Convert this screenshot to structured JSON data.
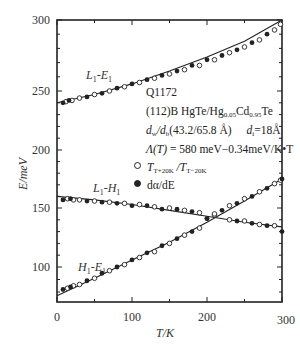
{
  "chart_data": {
    "type": "scatter",
    "title": "",
    "xlabel": "T/K",
    "ylabel": "E/meV",
    "xlim": [
      0,
      300
    ],
    "ylim": [
      72,
      300
    ],
    "xticks": [
      0,
      100,
      200,
      300
    ],
    "yticks": [
      100,
      150,
      200,
      250,
      300
    ],
    "grid": false,
    "legend_position": "inside right, middle",
    "legend": [
      {
        "marker": "open-circle",
        "label": "T_{T+20K}/T_{T-20K}"
      },
      {
        "marker": "filled-circle",
        "label": "dα/dE"
      }
    ],
    "annotations": {
      "sample": "Q1172",
      "structure": "(112)B HgTe/Hg0.05Cd0.95Te",
      "thickness": "dw/db(43.2/65.8 Å)   di=18Å",
      "gap_formula": "Λ(T) = 580 meV−0.34meV/K•T"
    },
    "series": [
      {
        "name": "L1-E1",
        "fit_line": {
          "x": [
            0,
            50,
            100,
            150,
            200,
            250,
            300
          ],
          "y": [
            240,
            247,
            255,
            264,
            274,
            285,
            300
          ]
        },
        "open_points": {
          "x": [
            12,
            20,
            30,
            50,
            70,
            90,
            110,
            130,
            150,
            170,
            190,
            210,
            230,
            250,
            270,
            290,
            298
          ],
          "y": [
            241,
            242,
            244,
            247,
            250,
            253,
            256,
            259,
            262,
            265,
            268,
            272,
            277,
            281,
            286,
            293,
            297
          ]
        },
        "filled_points": {
          "x": [
            8,
            16,
            40,
            60,
            80,
            100,
            120,
            140,
            160,
            180,
            200,
            220,
            240,
            260,
            280
          ],
          "y": [
            240,
            242,
            245,
            248,
            252,
            255,
            258,
            261,
            264,
            268,
            272,
            275,
            279,
            284,
            290
          ]
        }
      },
      {
        "name": "L1-H1",
        "fit_line": {
          "x": [
            0,
            50,
            100,
            150,
            200,
            250,
            300
          ],
          "y": [
            160,
            157,
            153,
            148,
            143,
            138,
            134
          ]
        },
        "open_points": {
          "x": [
            14,
            22,
            30,
            50,
            70,
            90,
            110,
            130,
            150,
            170,
            190,
            210,
            230,
            250,
            270,
            290
          ],
          "y": [
            158,
            157,
            157,
            156,
            155,
            154,
            153,
            151,
            150,
            148,
            146,
            144,
            140,
            139,
            136,
            135
          ]
        },
        "filled_points": {
          "x": [
            8,
            18,
            40,
            60,
            80,
            100,
            120,
            140,
            160,
            180,
            200,
            240,
            260,
            280,
            300
          ],
          "y": [
            157,
            158,
            156,
            155,
            154,
            152,
            152,
            149,
            149,
            147,
            141,
            139,
            137,
            135,
            130
          ]
        }
      },
      {
        "name": "H1-E1",
        "fit_line": {
          "x": [
            0,
            50,
            100,
            150,
            200,
            250,
            300
          ],
          "y": [
            77,
            91,
            106,
            121,
            138,
            156,
            175
          ]
        },
        "open_points": {
          "x": [
            14,
            22,
            30,
            50,
            70,
            90,
            110,
            130,
            150,
            170,
            190,
            210,
            230,
            250,
            270,
            290,
            298
          ],
          "y": [
            83,
            85,
            86,
            91,
            97,
            102,
            108,
            113,
            120,
            127,
            133,
            145,
            152,
            158,
            164,
            171,
            174
          ]
        },
        "filled_points": {
          "x": [
            8,
            18,
            40,
            60,
            80,
            100,
            120,
            140,
            160,
            180,
            200,
            220,
            240,
            260,
            280,
            300
          ],
          "y": [
            82,
            84,
            89,
            95,
            100,
            106,
            112,
            118,
            124,
            130,
            141,
            148,
            154,
            160,
            167,
            175
          ]
        }
      }
    ]
  },
  "labels": {
    "x_axis_title": "T/K",
    "y_axis_title": "E/meV",
    "curve_L1E1": "L1-E1",
    "curve_L1H1": "L1-H1",
    "curve_H1E1": "H1-E1",
    "sample": "Q1172",
    "structure_prefix": "(112)B HgTe/Hg",
    "structure_sub1": "0.05",
    "structure_mid": "Cd",
    "structure_sub2": "0.95",
    "structure_suffix": "Te",
    "thickness_dw": "d",
    "thickness_w_sub": "w",
    "thickness_sep": "/d",
    "thickness_b_sub": "b",
    "thickness_vals": "(43.2/65.8 Å)",
    "di_label": "d",
    "di_sub": "i",
    "di_val": "=18Å",
    "gap_lambda": "Λ(T)",
    "gap_rest": " = 580 meV−0.34meV/K•T",
    "legend_open_T": "T",
    "legend_open_sub1": "T+20K",
    "legend_open_sep": " /T",
    "legend_open_sub2": "T−20K",
    "legend_filled": "dα/dE"
  }
}
